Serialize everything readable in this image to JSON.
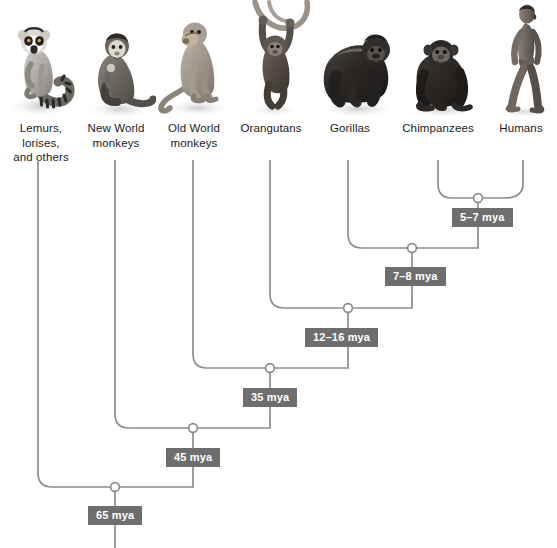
{
  "figure": {
    "width": 557,
    "height": 548,
    "background_color": "#ffffff",
    "branch_color": "#8d8d8d",
    "chip_color": "#6e6e6e",
    "chip_text_color": "#ffffff",
    "label_text_color": "#1b1b1b"
  },
  "taxa": [
    {
      "id": "lemurs",
      "label": "Lemurs, lorises,\nand others",
      "line1": "Lemurs, lorises,",
      "line2": "and others",
      "image_name": "ring-tailed-lemur-photo",
      "branch_x": 38
    },
    {
      "id": "new-world-monkeys",
      "label": "New World\nmonkeys",
      "line1": "New World",
      "line2": "monkeys",
      "image_name": "new-world-monkey-photo",
      "branch_x": 115
    },
    {
      "id": "old-world-monkeys",
      "label": "Old World\nmonkeys",
      "line1": "Old World",
      "line2": "monkeys",
      "image_name": "old-world-monkey-photo",
      "branch_x": 193
    },
    {
      "id": "orangutans",
      "label": "Orangutans",
      "line1": "Orangutans",
      "line2": "",
      "image_name": "orangutan-photo",
      "branch_x": 270
    },
    {
      "id": "gorillas",
      "label": "Gorillas",
      "line1": "Gorillas",
      "line2": "",
      "image_name": "gorilla-photo",
      "branch_x": 348
    },
    {
      "id": "chimpanzees",
      "label": "Chimpanzees",
      "line1": "Chimpanzees",
      "line2": "",
      "image_name": "chimpanzee-photo",
      "branch_x": 438
    },
    {
      "id": "humans",
      "label": "Humans",
      "line1": "Humans",
      "line2": "",
      "image_name": "human-photo",
      "branch_x": 523
    }
  ],
  "nodes": [
    {
      "id": "node-chimp-human",
      "time_label": "5–7 mya",
      "x": 478,
      "y": 198,
      "children": [
        "chimpanzees",
        "humans"
      ]
    },
    {
      "id": "node-gorilla-split",
      "time_label": "7–8 mya",
      "x": 412,
      "y": 248,
      "children": [
        "gorillas",
        "node-chimp-human"
      ]
    },
    {
      "id": "node-orangutan-split",
      "time_label": "12–16 mya",
      "x": 348,
      "y": 308,
      "children": [
        "orangutans",
        "node-gorilla-split"
      ]
    },
    {
      "id": "node-old-world-split",
      "time_label": "35 mya",
      "x": 270,
      "y": 368,
      "children": [
        "old-world-monkeys",
        "node-orangutan-split"
      ]
    },
    {
      "id": "node-new-world-split",
      "time_label": "45 mya",
      "x": 193,
      "y": 428,
      "children": [
        "new-world-monkeys",
        "node-old-world-split"
      ]
    },
    {
      "id": "node-root",
      "time_label": "65 mya",
      "x": 115,
      "y": 487,
      "children": [
        "lemurs",
        "node-new-world-split"
      ]
    }
  ],
  "chips": [
    {
      "id": "chip-5-7",
      "text": "5–7 mya",
      "left": 452,
      "top": 208
    },
    {
      "id": "chip-7-8",
      "text": "7–8 mya",
      "left": 385,
      "top": 267
    },
    {
      "id": "chip-12-16",
      "text": "12–16 mya",
      "left": 307,
      "top": 328
    },
    {
      "id": "chip-35",
      "text": "35 mya",
      "left": 243,
      "top": 388
    },
    {
      "id": "chip-45",
      "text": "45 mya",
      "left": 166,
      "top": 448
    },
    {
      "id": "chip-65",
      "text": "65 mya",
      "left": 88,
      "top": 506
    }
  ]
}
